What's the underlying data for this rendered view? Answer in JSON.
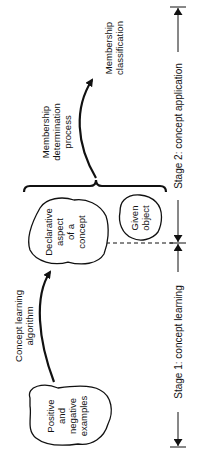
{
  "diagram": {
    "orientation": "rotated-90-ccw",
    "nodes": {
      "examples": {
        "lines": [
          "Positive",
          "and",
          "negative",
          "examples"
        ]
      },
      "declarative": {
        "lines": [
          "Declarative",
          "aspect",
          "of a",
          "concept"
        ]
      },
      "given_object": {
        "lines": [
          "Given",
          "object"
        ]
      },
      "membership_classification": {
        "lines": [
          "Membership",
          "classification"
        ]
      }
    },
    "edges": {
      "learning": {
        "lines": [
          "Concept learning",
          "algorithm"
        ]
      },
      "membership": {
        "lines": [
          "Membership",
          "determination",
          "process"
        ]
      }
    },
    "stages": {
      "stage1": {
        "label": "Stage 1: concept learning"
      },
      "stage2": {
        "label": "Stage 2: concept application"
      }
    }
  }
}
